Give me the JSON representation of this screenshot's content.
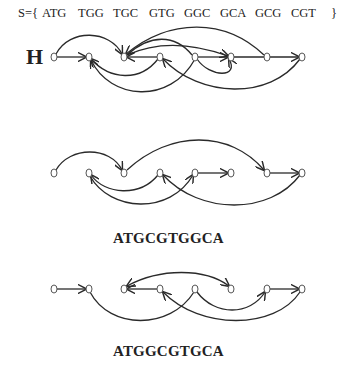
{
  "set_label": {
    "prefix": "S={",
    "items": [
      "ATG",
      "TGG",
      "TGC",
      "GTG",
      "GGC",
      "GCA",
      "GCG",
      "CGT"
    ],
    "suffix": "}"
  },
  "graph_H": {
    "label": "H"
  },
  "graph_2": {
    "sequence": "ATGCGTGGCA"
  },
  "graph_3": {
    "sequence": "ATGGCGTGCA"
  },
  "colors": {
    "stroke": "#2a2a2a",
    "node": "#555555"
  }
}
